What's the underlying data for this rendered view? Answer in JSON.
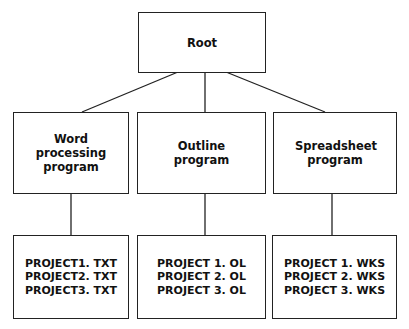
{
  "diagram": {
    "root": {
      "label": "Root"
    },
    "programs": [
      {
        "label": "Word processing program",
        "files": [
          "PROJECT1. TXT",
          "PROJECT2. TXT",
          "PROJECT3. TXT"
        ]
      },
      {
        "label": "Outline program",
        "files": [
          "PROJECT 1. OL",
          "PROJECT 2. OL",
          "PROJECT 3. OL"
        ]
      },
      {
        "label": "Spreadsheet program",
        "files": [
          "PROJECT 1. WKS",
          "PROJECT 2. WKS",
          "PROJECT 3. WKS"
        ]
      }
    ]
  }
}
